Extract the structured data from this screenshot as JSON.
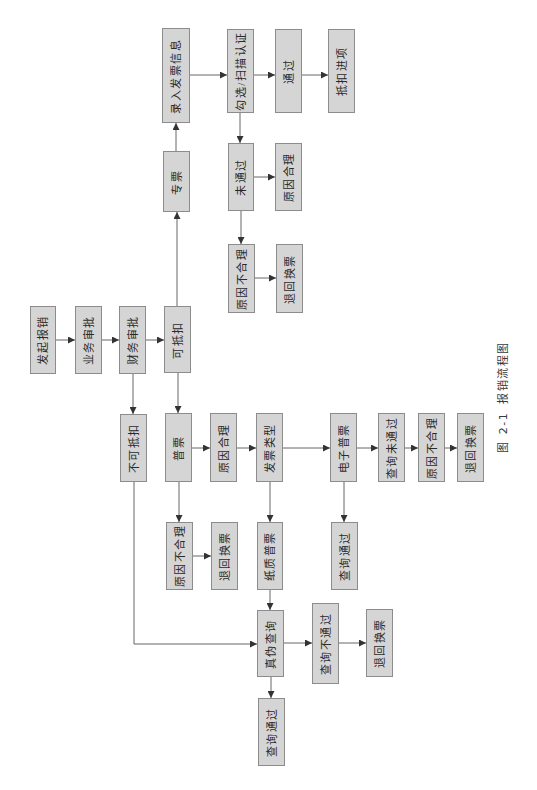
{
  "diagram": {
    "caption": {
      "prefix": "图",
      "number": "2-1",
      "title": "报销流程图"
    },
    "nodes": [
      {
        "label": "发起报销"
      },
      {
        "label": "业务审批"
      },
      {
        "label": "财务审批"
      },
      {
        "label": "可抵扣"
      },
      {
        "label": "专票"
      },
      {
        "label": "录入发票信息"
      },
      {
        "label": "勾选/扫描认证"
      },
      {
        "label": "通过"
      },
      {
        "label": "抵扣进项"
      },
      {
        "label": "未通过"
      },
      {
        "label": "原因合理"
      },
      {
        "label": "原因不合理"
      },
      {
        "label": "退回换票"
      },
      {
        "label": "不可抵扣"
      },
      {
        "label": "普票"
      },
      {
        "label": "原因合理"
      },
      {
        "label": "发票类型"
      },
      {
        "label": "电子普票"
      },
      {
        "label": "查询未通过"
      },
      {
        "label": "原因不合理"
      },
      {
        "label": "退回换票"
      },
      {
        "label": "原因不合理"
      },
      {
        "label": "退回换票"
      },
      {
        "label": "纸质普票"
      },
      {
        "label": "查询通过"
      },
      {
        "label": "真伪查询"
      },
      {
        "label": "查询不通过"
      },
      {
        "label": "退回换票"
      },
      {
        "label": "查询通过"
      }
    ],
    "edges": [
      {
        "from": 0,
        "to": 1
      },
      {
        "from": 1,
        "to": 2
      },
      {
        "from": 2,
        "to": 3
      },
      {
        "from": 3,
        "to": 4
      },
      {
        "from": 4,
        "to": 5
      },
      {
        "from": 5,
        "to": 6
      },
      {
        "from": 6,
        "to": 7
      },
      {
        "from": 7,
        "to": 8
      },
      {
        "from": 6,
        "to": 9
      },
      {
        "from": 9,
        "to": 10
      },
      {
        "from": 9,
        "to": 11
      },
      {
        "from": 11,
        "to": 12
      },
      {
        "from": 2,
        "to": 13
      },
      {
        "from": 3,
        "to": 14
      },
      {
        "from": 14,
        "to": 15
      },
      {
        "from": 15,
        "to": 16
      },
      {
        "from": 16,
        "to": 17
      },
      {
        "from": 17,
        "to": 18
      },
      {
        "from": 18,
        "to": 19
      },
      {
        "from": 19,
        "to": 20
      },
      {
        "from": 14,
        "to": 21
      },
      {
        "from": 21,
        "to": 22
      },
      {
        "from": 16,
        "to": 23
      },
      {
        "from": 17,
        "to": 24
      },
      {
        "from": 23,
        "to": 25
      },
      {
        "from": 13,
        "to": 25
      },
      {
        "from": 25,
        "to": 26
      },
      {
        "from": 26,
        "to": 27
      },
      {
        "from": 25,
        "to": 28
      }
    ],
    "colors": {
      "node_fill": "#d5d5d5",
      "node_border": "#8c8c8c",
      "edge": "#666666",
      "text": "#2a2a2a"
    }
  }
}
